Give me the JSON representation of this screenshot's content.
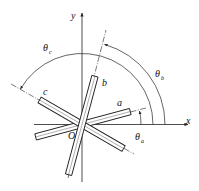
{
  "diagram": {
    "title": "",
    "axes": {
      "x_label": "x",
      "y_label": "y",
      "origin_label": "O"
    },
    "bars": [
      {
        "id": "a",
        "label": "a",
        "angle_deg": 15
      },
      {
        "id": "b",
        "label": "b",
        "angle_deg": 75
      },
      {
        "id": "c",
        "label": "c",
        "angle_deg": 150
      }
    ],
    "angles": [
      {
        "symbol": "θ",
        "subscript": "a",
        "from": "x-axis",
        "to": "a"
      },
      {
        "symbol": "θ",
        "subscript": "b",
        "from": "x-axis",
        "to": "b"
      },
      {
        "symbol": "θ",
        "subscript": "c",
        "from": "x-axis",
        "to": "c"
      }
    ],
    "colors": {
      "stroke": "#222222",
      "background": "#ffffff"
    }
  }
}
